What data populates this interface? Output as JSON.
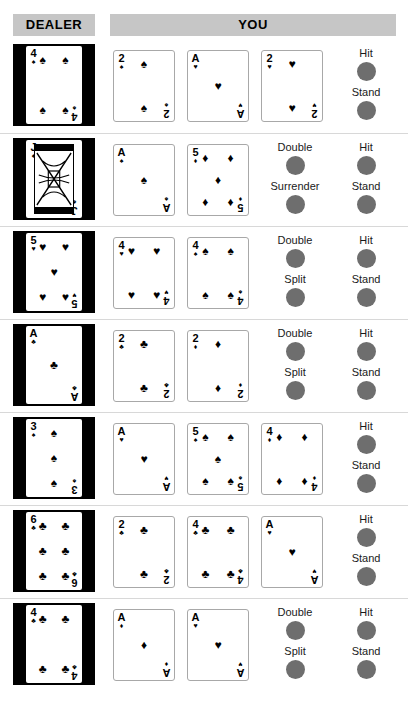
{
  "header": {
    "dealer_label": "DEALER",
    "you_label": "YOU",
    "band_color": "#c6c6c6"
  },
  "theme": {
    "button_color": "#6e6e6e",
    "dealer_frame_color": "#000000",
    "card_border_color": "#a8a8a8",
    "row_divider_color": "#d8d8d8"
  },
  "suits": {
    "spade": "♠",
    "heart": "♥",
    "diamond": "♦",
    "club": "♣"
  },
  "rows": [
    {
      "dealer": {
        "rank": "4",
        "suit": "spade",
        "pip_count": 4,
        "face": false
      },
      "player": [
        {
          "rank": "2",
          "suit": "spade",
          "pip_count": 2,
          "face": false
        },
        {
          "rank": "A",
          "suit": "heart",
          "pip_count": 1,
          "face": false
        },
        {
          "rank": "2",
          "suit": "heart",
          "pip_count": 2,
          "face": false
        }
      ],
      "actions_left": [],
      "actions_right": [
        "Hit",
        "Stand"
      ]
    },
    {
      "dealer": {
        "rank": "J",
        "suit": "spade",
        "pip_count": 0,
        "face": true
      },
      "player": [
        {
          "rank": "A",
          "suit": "spade",
          "pip_count": 1,
          "face": false
        },
        {
          "rank": "5",
          "suit": "diamond",
          "pip_count": 5,
          "face": false
        }
      ],
      "actions_left": [
        "Double",
        "Surrender"
      ],
      "actions_right": [
        "Hit",
        "Stand"
      ]
    },
    {
      "dealer": {
        "rank": "5",
        "suit": "heart",
        "pip_count": 5,
        "face": false
      },
      "player": [
        {
          "rank": "4",
          "suit": "heart",
          "pip_count": 4,
          "face": false
        },
        {
          "rank": "4",
          "suit": "spade",
          "pip_count": 4,
          "face": false
        }
      ],
      "actions_left": [
        "Double",
        "Split"
      ],
      "actions_right": [
        "Hit",
        "Stand"
      ]
    },
    {
      "dealer": {
        "rank": "A",
        "suit": "club",
        "pip_count": 1,
        "face": false
      },
      "player": [
        {
          "rank": "2",
          "suit": "club",
          "pip_count": 2,
          "face": false
        },
        {
          "rank": "2",
          "suit": "diamond",
          "pip_count": 2,
          "face": false
        }
      ],
      "actions_left": [
        "Double",
        "Split"
      ],
      "actions_right": [
        "Hit",
        "Stand"
      ]
    },
    {
      "dealer": {
        "rank": "3",
        "suit": "spade",
        "pip_count": 3,
        "face": false
      },
      "player": [
        {
          "rank": "A",
          "suit": "heart",
          "pip_count": 1,
          "face": false
        },
        {
          "rank": "5",
          "suit": "spade",
          "pip_count": 5,
          "face": false
        },
        {
          "rank": "4",
          "suit": "diamond",
          "pip_count": 4,
          "face": false
        }
      ],
      "actions_left": [],
      "actions_right": [
        "Hit",
        "Stand"
      ]
    },
    {
      "dealer": {
        "rank": "6",
        "suit": "club",
        "pip_count": 6,
        "face": false
      },
      "player": [
        {
          "rank": "2",
          "suit": "club",
          "pip_count": 2,
          "face": false
        },
        {
          "rank": "4",
          "suit": "club",
          "pip_count": 4,
          "face": false
        },
        {
          "rank": "A",
          "suit": "heart",
          "pip_count": 1,
          "face": false
        }
      ],
      "actions_left": [],
      "actions_right": [
        "Hit",
        "Stand"
      ]
    },
    {
      "dealer": {
        "rank": "4",
        "suit": "club",
        "pip_count": 4,
        "face": false
      },
      "player": [
        {
          "rank": "A",
          "suit": "diamond",
          "pip_count": 1,
          "face": false
        },
        {
          "rank": "A",
          "suit": "heart",
          "pip_count": 1,
          "face": false
        }
      ],
      "actions_left": [
        "Double",
        "Split"
      ],
      "actions_right": [
        "Hit",
        "Stand"
      ]
    }
  ]
}
